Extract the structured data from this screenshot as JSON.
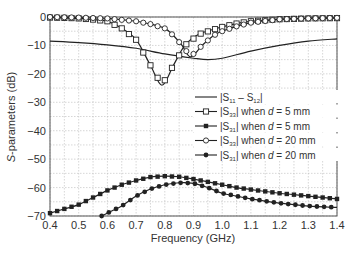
{
  "chart_data": {
    "type": "line",
    "title": "",
    "xlabel": "Frequency (GHz)",
    "ylabel": "S-parameters (dB)",
    "xlim": [
      0.4,
      1.4
    ],
    "ylim": [
      -70,
      0
    ],
    "xticks": [
      "0.4",
      "0.5",
      "0.6",
      "0.7",
      "0.8",
      "0.9",
      "1.0",
      "1.1",
      "1.2",
      "1.3",
      "1.4"
    ],
    "yticks": [
      "0",
      "−10",
      "−20",
      "−30",
      "−40",
      "−50",
      "−60",
      "−70"
    ],
    "grid": true,
    "legend_position": "center-right",
    "series": [
      {
        "name": "|S11 − S12|",
        "marker": "none",
        "x": [
          0.4,
          0.5,
          0.6,
          0.7,
          0.8,
          0.9,
          0.95,
          1.0,
          1.1,
          1.2,
          1.3,
          1.4
        ],
        "values": [
          -8.5,
          -9,
          -9.8,
          -11,
          -13,
          -14.5,
          -15,
          -14.5,
          -12,
          -10,
          -8.5,
          -7.7
        ]
      },
      {
        "name": "|S33| when d = 5 mm",
        "marker": "open-square",
        "x": [
          0.4,
          0.45,
          0.5,
          0.55,
          0.6,
          0.65,
          0.7,
          0.75,
          0.79,
          0.83,
          0.87,
          0.92,
          1.0,
          1.05,
          1.1,
          1.2,
          1.3,
          1.4
        ],
        "values": [
          -0.2,
          -0.3,
          -0.5,
          -0.9,
          -1.5,
          -4,
          -8,
          -17,
          -24,
          -17,
          -10,
          -6,
          -3.5,
          -2.3,
          -1.5,
          -0.8,
          -0.5,
          -0.4
        ]
      },
      {
        "name": "|S31| when d = 5 mm",
        "marker": "filled-square",
        "x": [
          0.4,
          0.45,
          0.5,
          0.55,
          0.6,
          0.65,
          0.7,
          0.75,
          0.8,
          0.85,
          0.9,
          0.95,
          1.0,
          1.05,
          1.1,
          1.2,
          1.3,
          1.4
        ],
        "values": [
          -69,
          -67.5,
          -66,
          -63.5,
          -61,
          -59,
          -57.5,
          -56.3,
          -56,
          -56.2,
          -57,
          -58,
          -59,
          -60,
          -60.7,
          -62,
          -63,
          -64
        ]
      },
      {
        "name": "|S33| when d = 20 mm",
        "marker": "open-circle",
        "x": [
          0.4,
          0.5,
          0.6,
          0.7,
          0.75,
          0.8,
          0.83,
          0.86,
          0.89,
          0.93,
          0.97,
          1.0,
          1.05,
          1.1,
          1.2,
          1.3,
          1.4
        ],
        "values": [
          0,
          -0.2,
          -0.5,
          -1.5,
          -2.5,
          -4,
          -6.5,
          -10,
          -14,
          -10,
          -6.5,
          -5,
          -3.3,
          -2,
          -0.8,
          -0.5,
          -0.3
        ]
      },
      {
        "name": "|S31| when d = 20 mm",
        "marker": "filled-circle",
        "x": [
          0.58,
          0.62,
          0.65,
          0.7,
          0.75,
          0.8,
          0.85,
          0.9,
          0.95,
          1.0,
          1.05,
          1.1,
          1.2,
          1.3,
          1.4
        ],
        "values": [
          -70,
          -68,
          -66.5,
          -63,
          -60.5,
          -59,
          -58.3,
          -58.5,
          -60,
          -62,
          -63,
          -64,
          -65.5,
          -66.5,
          -67
        ]
      }
    ]
  },
  "legend": {
    "items": [
      {
        "prefix": "|S",
        "sub": "11",
        "mid": " – S",
        "sub2": "12",
        "suffix": "|",
        "when": ""
      },
      {
        "prefix": "|S",
        "sub": "33",
        "suffix": "| when ",
        "var": "d",
        "eq": " = 5 mm"
      },
      {
        "prefix": "|S",
        "sub": "31",
        "suffix": "| when ",
        "var": "d",
        "eq": " = 5 mm"
      },
      {
        "prefix": "|S",
        "sub": "33",
        "suffix": "| when ",
        "var": "d",
        "eq": " = 20 mm"
      },
      {
        "prefix": "|S",
        "sub": "31",
        "suffix": "| when ",
        "var": "d",
        "eq": " = 20 mm"
      }
    ]
  },
  "axes": {
    "xlabel": "Frequency (GHz)",
    "ylabel_italic": "S",
    "ylabel_rest": "-parameters (dB)"
  },
  "colors": {
    "line": "#222222",
    "grid": "#bbbbbb",
    "axis": "#555555"
  }
}
